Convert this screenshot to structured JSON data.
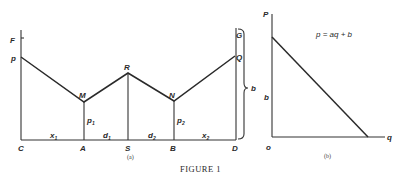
{
  "figure": {
    "caption": "FIGURE 1",
    "panel_a": {
      "label": "(a)",
      "points": {
        "F": "F",
        "P": "p",
        "M": "M",
        "R": "R",
        "N": "N",
        "Q": "Q",
        "G": "G",
        "C": "C",
        "A": "A",
        "S": "S",
        "B": "B",
        "D": "D"
      },
      "segments": {
        "x1": "x",
        "x1_sub": "1",
        "d1": "d",
        "d1_sub": "1",
        "d2": "d",
        "d2_sub": "2",
        "x2": "x",
        "x2_sub": "2",
        "p1": "p",
        "p1_sub": "1",
        "p2": "p",
        "p2_sub": "2"
      },
      "brace_label": "b"
    },
    "panel_b": {
      "label": "(b)",
      "y_axis": "P",
      "x_axis": "q",
      "origin": "o",
      "intercept": "b",
      "equation": "p = aq + b"
    }
  }
}
